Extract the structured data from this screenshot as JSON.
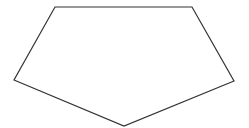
{
  "diagram": {
    "shape": "pentagon",
    "fill": "#ffffff",
    "stroke": "#333333",
    "stroke_width": 1.2,
    "points": "55,7 192,7 234,81 124,126 14,80"
  }
}
